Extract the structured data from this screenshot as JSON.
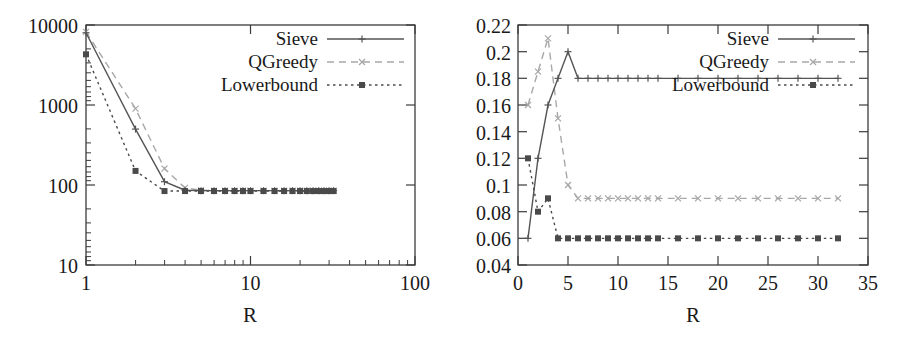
{
  "figure": {
    "panel_count": 2,
    "background_color": "#ffffff",
    "ink_color": "#1a1a1a"
  },
  "series_style": {
    "sieve_color": "#555555",
    "qgreedy_color": "#a8a8a8",
    "lowerbound_color": "#4a4a4a"
  },
  "chart_data": [
    {
      "type": "line",
      "panel": "left",
      "title": "",
      "xlabel": "R",
      "ylabel": "",
      "xscale": "log",
      "yscale": "log",
      "xlim": [
        1,
        100
      ],
      "ylim": [
        10,
        10000
      ],
      "xticks": [
        1,
        10,
        100
      ],
      "xtick_labels": [
        "1",
        "10",
        "100"
      ],
      "yticks": [
        10,
        100,
        1000,
        10000
      ],
      "ytick_labels": [
        "10",
        "100",
        "1000",
        "10000"
      ],
      "grid": false,
      "legend_position": "top-right",
      "series": [
        {
          "name": "Sieve",
          "marker": "plus",
          "linestyle": "solid",
          "x": [
            1,
            2,
            3,
            4,
            5,
            6,
            7,
            8,
            9,
            10,
            12,
            14,
            16,
            18,
            20,
            22,
            24,
            26,
            28,
            30,
            32
          ],
          "values": [
            8000,
            500,
            110,
            86,
            85,
            85,
            85,
            85,
            85,
            85,
            85,
            85,
            85,
            85,
            85,
            85,
            85,
            85,
            85,
            85,
            85
          ]
        },
        {
          "name": "QGreedy",
          "marker": "cross",
          "linestyle": "dashed",
          "x": [
            1,
            2,
            3,
            4,
            5,
            6,
            7,
            8,
            9,
            10,
            12,
            14,
            16,
            18,
            20,
            22,
            24,
            26,
            28,
            30,
            32
          ],
          "values": [
            8200,
            900,
            160,
            92,
            86,
            85,
            85,
            85,
            85,
            85,
            85,
            85,
            85,
            85,
            85,
            85,
            85,
            85,
            85,
            85,
            85
          ]
        },
        {
          "name": "Lowerbound",
          "marker": "square",
          "linestyle": "dotted",
          "x": [
            1,
            2,
            3,
            4,
            5,
            6,
            7,
            8,
            9,
            10,
            12,
            14,
            16,
            18,
            20,
            22,
            24,
            26,
            28,
            30,
            32
          ],
          "values": [
            4300,
            150,
            84,
            84,
            84,
            84,
            84,
            84,
            84,
            84,
            84,
            84,
            84,
            84,
            84,
            84,
            84,
            84,
            84,
            84,
            84
          ]
        }
      ]
    },
    {
      "type": "line",
      "panel": "right",
      "title": "",
      "xlabel": "R",
      "ylabel": "",
      "xscale": "linear",
      "yscale": "linear",
      "xlim": [
        0,
        35
      ],
      "ylim": [
        0.04,
        0.22
      ],
      "xticks": [
        0,
        5,
        10,
        15,
        20,
        25,
        30,
        35
      ],
      "xtick_labels": [
        "0",
        "5",
        "10",
        "15",
        "20",
        "25",
        "30",
        "35"
      ],
      "yticks": [
        0.04,
        0.06,
        0.08,
        0.1,
        0.12,
        0.14,
        0.16,
        0.18,
        0.2,
        0.22
      ],
      "ytick_labels": [
        "0.04",
        "0.06",
        "0.08",
        "0.1",
        "0.12",
        "0.14",
        "0.16",
        "0.18",
        "0.2",
        "0.22"
      ],
      "grid": false,
      "legend_position": "top-right",
      "series": [
        {
          "name": "Sieve",
          "marker": "plus",
          "linestyle": "solid",
          "x": [
            1,
            2,
            3,
            4,
            5,
            6,
            7,
            8,
            9,
            10,
            11,
            12,
            13,
            14,
            16,
            18,
            20,
            22,
            24,
            26,
            28,
            30,
            32
          ],
          "values": [
            0.06,
            0.12,
            0.16,
            0.18,
            0.2,
            0.18,
            0.18,
            0.18,
            0.18,
            0.18,
            0.18,
            0.18,
            0.18,
            0.18,
            0.18,
            0.18,
            0.18,
            0.18,
            0.18,
            0.18,
            0.18,
            0.18,
            0.18
          ]
        },
        {
          "name": "QGreedy",
          "marker": "cross",
          "linestyle": "dashed",
          "x": [
            1,
            2,
            3,
            4,
            5,
            6,
            7,
            8,
            9,
            10,
            11,
            12,
            13,
            14,
            16,
            18,
            20,
            22,
            24,
            26,
            28,
            30,
            32
          ],
          "values": [
            0.16,
            0.185,
            0.21,
            0.15,
            0.1,
            0.09,
            0.09,
            0.09,
            0.09,
            0.09,
            0.09,
            0.09,
            0.09,
            0.09,
            0.09,
            0.09,
            0.09,
            0.09,
            0.09,
            0.09,
            0.09,
            0.09,
            0.09
          ]
        },
        {
          "name": "Lowerbound",
          "marker": "square",
          "linestyle": "dotted",
          "x": [
            1,
            2,
            3,
            4,
            5,
            6,
            7,
            8,
            9,
            10,
            11,
            12,
            13,
            14,
            16,
            18,
            20,
            22,
            24,
            26,
            28,
            30,
            32
          ],
          "values": [
            0.12,
            0.08,
            0.09,
            0.06,
            0.06,
            0.06,
            0.06,
            0.06,
            0.06,
            0.06,
            0.06,
            0.06,
            0.06,
            0.06,
            0.06,
            0.06,
            0.06,
            0.06,
            0.06,
            0.06,
            0.06,
            0.06,
            0.06
          ]
        }
      ]
    }
  ],
  "left_panel": {
    "xlabel": "R",
    "ytick_labels": [
      "10000",
      "1000",
      "100",
      "10"
    ],
    "xtick_labels": [
      "1",
      "10",
      "100"
    ],
    "legend": {
      "sieve": "Sieve",
      "qgreedy": "QGreedy",
      "lowerbound": "Lowerbound"
    }
  },
  "right_panel": {
    "xlabel": "R",
    "ytick_labels": [
      "0.22",
      "0.2",
      "0.18",
      "0.16",
      "0.14",
      "0.12",
      "0.1",
      "0.08",
      "0.06",
      "0.04"
    ],
    "xtick_labels": [
      "0",
      "5",
      "10",
      "15",
      "20",
      "25",
      "30",
      "35"
    ],
    "legend": {
      "sieve": "Sieve",
      "qgreedy": "QGreedy",
      "lowerbound": "Lowerbound"
    }
  }
}
